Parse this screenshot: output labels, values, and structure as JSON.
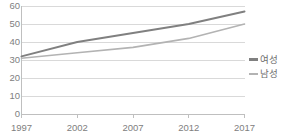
{
  "chart_data": {
    "type": "line",
    "title": "",
    "xlabel": "",
    "ylabel": "",
    "categories": [
      "1997",
      "2002",
      "2007",
      "2012",
      "2017"
    ],
    "x": [
      1997,
      2002,
      2007,
      2012,
      2017
    ],
    "series": [
      {
        "name": "여성",
        "values": [
          32,
          40,
          45,
          50,
          57
        ],
        "color": "#808080"
      },
      {
        "name": "남성",
        "values": [
          31,
          34,
          37,
          42,
          50
        ],
        "color": "#b3b3b3"
      }
    ],
    "ylim": [
      0,
      60
    ],
    "yticks": [
      "0",
      "10",
      "20",
      "30",
      "40",
      "50",
      "60"
    ],
    "ytick_values": [
      0,
      10,
      20,
      30,
      40,
      50,
      60
    ],
    "xticks": [
      "1997",
      "2002",
      "2007",
      "2012",
      "2017"
    ],
    "grid": true,
    "grid_axis": "y",
    "legend_position": "right",
    "legend": [
      "여성",
      "남성"
    ],
    "axis_color": "#bfbfbf",
    "grid_color": "#d9d9d9",
    "tick_label_color": "#808080"
  }
}
